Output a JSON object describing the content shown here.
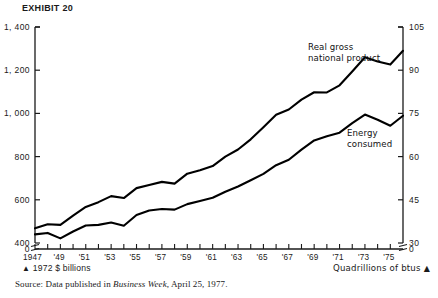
{
  "exhibit": {
    "title": "EXHIBIT 20"
  },
  "footer": {
    "legend_left_marker": "▲",
    "legend_left": "1972 $ billions",
    "legend_right": "Quadrillions of btus",
    "legend_right_marker": "▲",
    "source_prefix": "Source: Data published in ",
    "source_italic": "Business Week",
    "source_suffix": ", April 25, 1977."
  },
  "chart_data": {
    "type": "line",
    "title": "EXHIBIT 20",
    "xlabel": "",
    "ylabel": "1972 $ billions",
    "y2label": "Quadrillions of btus",
    "grid": false,
    "legend_position": "inline-annotation",
    "axis_break": true,
    "x": [
      1947,
      1948,
      1949,
      1950,
      1951,
      1952,
      1953,
      1954,
      1955,
      1956,
      1957,
      1958,
      1959,
      1960,
      1961,
      1962,
      1963,
      1964,
      1965,
      1966,
      1967,
      1968,
      1969,
      1970,
      1971,
      1972,
      1973,
      1974,
      1975,
      1976
    ],
    "xtick_labels": [
      "1947",
      "'49",
      "'51",
      "'53",
      "'55",
      "'57",
      "'59",
      "'61",
      "'63",
      "'65",
      "'67",
      "'69",
      "'71",
      "'73",
      "'75"
    ],
    "ylim": [
      400,
      1400
    ],
    "yticks": [
      400,
      600,
      800,
      1000,
      1200,
      1400
    ],
    "ytick_labels": [
      "400",
      "600",
      "800",
      "1, 000",
      "1, 200",
      "1, 400"
    ],
    "y_zero_label": "0",
    "y2lim": [
      30,
      105
    ],
    "y2ticks": [
      30,
      45,
      60,
      75,
      90,
      105
    ],
    "y2tick_labels": [
      "30",
      "45",
      "60",
      "75",
      "90",
      "105"
    ],
    "y2_zero_label": "0",
    "series": [
      {
        "name": "Real gross national product",
        "axis": "left",
        "units": "1972 $ billions",
        "values": [
          468,
          487,
          484,
          527,
          567,
          589,
          617,
          608,
          654,
          669,
          683,
          675,
          721,
          737,
          756,
          800,
          833,
          880,
          936,
          994,
          1018,
          1064,
          1098,
          1097,
          1130,
          1194,
          1260,
          1240,
          1226,
          1290
        ]
      },
      {
        "name": "Energy consumed",
        "axis": "right",
        "units": "Quadrillions of btus",
        "values": [
          33.0,
          33.5,
          31.6,
          34.0,
          36.1,
          36.3,
          37.1,
          36.0,
          39.7,
          41.3,
          41.8,
          41.6,
          43.5,
          44.6,
          45.7,
          47.8,
          49.6,
          51.8,
          54.0,
          57.0,
          58.9,
          62.4,
          65.6,
          67.1,
          68.3,
          71.6,
          74.6,
          72.8,
          70.7,
          74.2
        ]
      }
    ],
    "annotations": [
      {
        "text": "Real gross national product",
        "series": "Real gross national product"
      },
      {
        "text": "Energy consumed",
        "series": "Energy consumed"
      }
    ]
  }
}
